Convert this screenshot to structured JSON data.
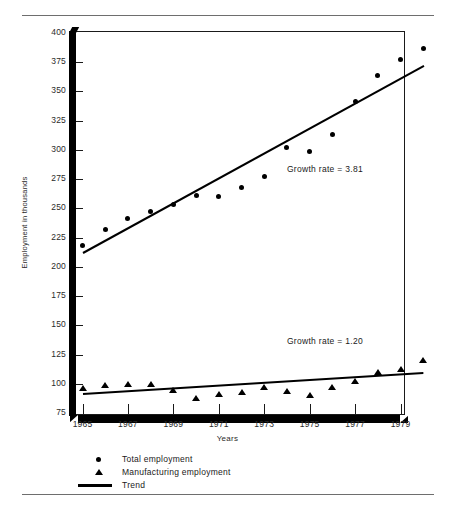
{
  "chart_data": {
    "type": "scatter",
    "title": "",
    "xlabel": "Years",
    "ylabel": "Employment in thousands",
    "xlim": [
      1965,
      1980
    ],
    "ylim": [
      75,
      400
    ],
    "yticks": [
      400,
      375,
      350,
      325,
      300,
      275,
      250,
      225,
      200,
      175,
      150,
      125,
      100,
      75
    ],
    "xticks": [
      1965,
      1967,
      1969,
      1971,
      1973,
      1975,
      1977,
      1979
    ],
    "grid": false,
    "legend_position": "below-axes",
    "legend": [
      {
        "label": "Total employment",
        "marker": "circle"
      },
      {
        "label": "Manufacturing employment",
        "marker": "triangle"
      },
      {
        "label": "Trend",
        "marker": "line"
      }
    ],
    "x": [
      1965,
      1966,
      1967,
      1968,
      1969,
      1970,
      1971,
      1972,
      1973,
      1974,
      1975,
      1976,
      1977,
      1978,
      1979,
      1980
    ],
    "series": [
      {
        "name": "Total employment",
        "marker": "circle",
        "values": [
          218,
          232,
          241,
          247,
          253,
          261,
          260,
          268,
          277,
          302,
          299,
          313,
          341,
          364,
          377,
          387
        ]
      },
      {
        "name": "Manufacturing employment",
        "marker": "triangle",
        "values": [
          96,
          99,
          100,
          100,
          95,
          88,
          91,
          93,
          97,
          94,
          90,
          97,
          102,
          110,
          113,
          120
        ]
      }
    ],
    "trend_lines": [
      {
        "name": "Total employment trend",
        "growth_rate_label": "Growth rate = 3.81",
        "growth_rate": 3.81,
        "x_start": 1965,
        "y_start": 213,
        "x_end": 1980,
        "y_end": 373
      },
      {
        "name": "Manufacturing employment trend",
        "growth_rate_label": "Growth rate = 1.20",
        "growth_rate": 1.2,
        "x_start": 1965,
        "y_start": 92,
        "x_end": 1980,
        "y_end": 110
      }
    ],
    "annotations": [
      {
        "text": "Growth rate = 3.81",
        "x": 1974.0,
        "y": 283
      },
      {
        "text": "Growth rate = 1.20",
        "x": 1974.0,
        "y": 136
      }
    ],
    "colors": {
      "marker": "#000000",
      "trend": "#000000",
      "axis": "#1a1a1a",
      "text": "#2a2a2a"
    }
  }
}
